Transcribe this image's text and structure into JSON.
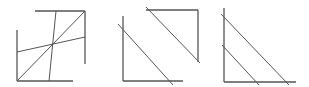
{
  "diagram": {
    "background": "#ffffff",
    "stroke_color": "#555555",
    "figures": [
      {
        "name": "figure-1-square-with-crossing-lines",
        "lines": [
          {
            "name": "left-edge",
            "x1": 17,
            "y1": 30,
            "x2": 17,
            "y2": 81,
            "w": 1.3
          },
          {
            "name": "bottom-edge",
            "x1": 17,
            "y1": 81,
            "x2": 73,
            "y2": 81,
            "w": 1.3
          },
          {
            "name": "top-edge",
            "x1": 35,
            "y1": 11,
            "x2": 85,
            "y2": 11,
            "w": 1.3
          },
          {
            "name": "right-edge",
            "x1": 85,
            "y1": 11,
            "x2": 85,
            "y2": 64,
            "w": 1.3
          },
          {
            "name": "main-diagonal",
            "x1": 17,
            "y1": 81,
            "x2": 85,
            "y2": 11,
            "w": 1
          },
          {
            "name": "near-vertical-line",
            "x1": 56,
            "y1": 11,
            "x2": 49,
            "y2": 81,
            "w": 1
          },
          {
            "name": "shallow-line",
            "x1": 17,
            "y1": 52,
            "x2": 85,
            "y2": 37,
            "w": 1
          }
        ]
      },
      {
        "name": "figure-2-two-corners-with-parallels",
        "lines": [
          {
            "name": "lower-left-vertical",
            "x1": 123,
            "y1": 16,
            "x2": 123,
            "y2": 81,
            "w": 1.3
          },
          {
            "name": "lower-left-horizontal",
            "x1": 123,
            "y1": 81,
            "x2": 183,
            "y2": 81,
            "w": 1.3
          },
          {
            "name": "lower-diagonal",
            "x1": 118,
            "y1": 24,
            "x2": 173,
            "y2": 85,
            "w": 1
          },
          {
            "name": "upper-right-horizontal",
            "x1": 146,
            "y1": 10,
            "x2": 198,
            "y2": 10,
            "w": 1.3
          },
          {
            "name": "upper-right-vertical",
            "x1": 198,
            "y1": 10,
            "x2": 198,
            "y2": 62,
            "w": 1.3
          },
          {
            "name": "upper-diagonal",
            "x1": 146,
            "y1": 7,
            "x2": 200,
            "y2": 63,
            "w": 1
          }
        ]
      },
      {
        "name": "figure-3-corner-with-two-diagonals",
        "lines": [
          {
            "name": "vertical-axis",
            "x1": 224,
            "y1": 8,
            "x2": 224,
            "y2": 82,
            "w": 1.3
          },
          {
            "name": "horizontal-axis",
            "x1": 224,
            "y1": 82,
            "x2": 296,
            "y2": 82,
            "w": 1.3
          },
          {
            "name": "long-diagonal",
            "x1": 221,
            "y1": 14,
            "x2": 289,
            "y2": 85,
            "w": 1
          },
          {
            "name": "short-diagonal",
            "x1": 222,
            "y1": 45,
            "x2": 259,
            "y2": 85,
            "w": 1
          }
        ]
      }
    ]
  }
}
